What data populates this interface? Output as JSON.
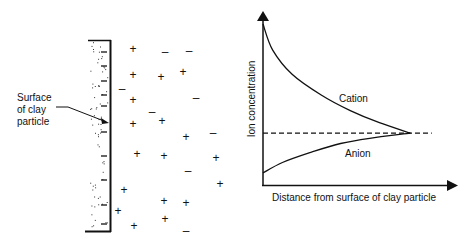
{
  "left_panel": {
    "label_lines": [
      "Surface",
      "of clay",
      "particle"
    ],
    "ion_symbols": {
      "cation": "+",
      "anion": "–"
    },
    "surface_charges": "negative",
    "ions": [
      {
        "type": "cation",
        "x": 133,
        "y": 50
      },
      {
        "type": "anion",
        "x": 165,
        "y": 53
      },
      {
        "type": "anion",
        "x": 189,
        "y": 52
      },
      {
        "type": "cation",
        "x": 133,
        "y": 76
      },
      {
        "type": "cation",
        "x": 161,
        "y": 78
      },
      {
        "type": "cation",
        "x": 183,
        "y": 73
      },
      {
        "type": "anion",
        "x": 122,
        "y": 90
      },
      {
        "type": "cation",
        "x": 133,
        "y": 101
      },
      {
        "type": "anion",
        "x": 196,
        "y": 99
      },
      {
        "type": "anion",
        "x": 152,
        "y": 113
      },
      {
        "type": "cation",
        "x": 162,
        "y": 122
      },
      {
        "type": "cation",
        "x": 133,
        "y": 125
      },
      {
        "type": "cation",
        "x": 186,
        "y": 138
      },
      {
        "type": "anion",
        "x": 213,
        "y": 134
      },
      {
        "type": "cation",
        "x": 137,
        "y": 155
      },
      {
        "type": "cation",
        "x": 164,
        "y": 157
      },
      {
        "type": "cation",
        "x": 216,
        "y": 159
      },
      {
        "type": "anion",
        "x": 188,
        "y": 172
      },
      {
        "type": "cation",
        "x": 220,
        "y": 185
      },
      {
        "type": "cation",
        "x": 124,
        "y": 191
      },
      {
        "type": "cation",
        "x": 164,
        "y": 202
      },
      {
        "type": "cation",
        "x": 186,
        "y": 204
      },
      {
        "type": "cation",
        "x": 118,
        "y": 212
      },
      {
        "type": "cation",
        "x": 165,
        "y": 220
      },
      {
        "type": "cation",
        "x": 134,
        "y": 227
      },
      {
        "type": "anion",
        "x": 186,
        "y": 232
      }
    ]
  },
  "chart_data": {
    "type": "line",
    "title": "",
    "xlabel": "Distance from surface of clay particle",
    "ylabel": "Ion concentration",
    "axis_ticks": "none",
    "series": [
      {
        "name": "Cation",
        "label": "Cation",
        "shape": "decreasing exponential",
        "start": "high at surface",
        "end": "equilibrium concentration"
      },
      {
        "name": "Anion",
        "label": "Anion",
        "shape": "increasing, concave",
        "start": "low at surface",
        "end": "equilibrium concentration"
      }
    ],
    "reference_line": {
      "style": "dashed",
      "meaning": "bulk solution concentration"
    },
    "curves_normalized": {
      "x_meet": 0.76,
      "y_ref": 0.3,
      "cation": [
        [
          0,
          0.93
        ],
        [
          0.05,
          0.78
        ],
        [
          0.15,
          0.64
        ],
        [
          0.3,
          0.52
        ],
        [
          0.45,
          0.43
        ],
        [
          0.6,
          0.36
        ],
        [
          0.76,
          0.3
        ]
      ],
      "anion": [
        [
          0,
          0.07
        ],
        [
          0.1,
          0.13
        ],
        [
          0.25,
          0.19
        ],
        [
          0.4,
          0.24
        ],
        [
          0.55,
          0.27
        ],
        [
          0.76,
          0.3
        ]
      ]
    },
    "grid": false,
    "legend": "inline labels"
  }
}
